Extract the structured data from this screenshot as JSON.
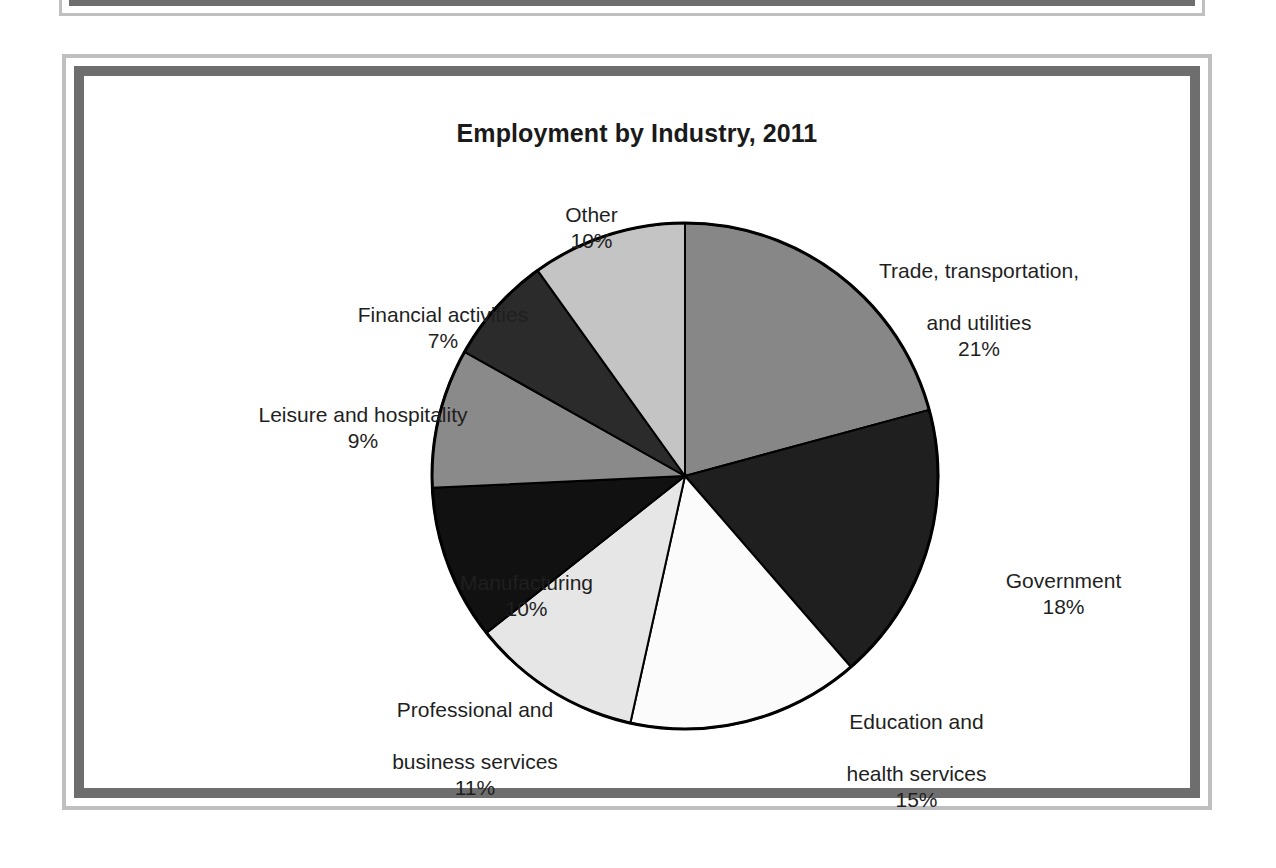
{
  "figure": {
    "title": "Employment by Industry, 2011"
  },
  "chart_data": {
    "type": "pie",
    "title": "Employment by Industry, 2011",
    "xlabel": "",
    "ylabel": "",
    "units": "percent",
    "legend_position": "none",
    "grid": false,
    "start_angle_deg": 0,
    "direction": "clockwise",
    "categories": [
      "Trade, transportation, and utilities",
      "Government",
      "Education and health services",
      "Professional and business services",
      "Manufacturing",
      "Leisure and hospitality",
      "Financial activities",
      "Other"
    ],
    "values": [
      21,
      18,
      15,
      11,
      10,
      9,
      7,
      10
    ],
    "slice_colors": [
      "#878787",
      "#1f1f1f",
      "#fbfbfb",
      "#e6e6e6",
      "#111111",
      "#8a8a8a",
      "#2b2b2b",
      "#c4c4c4"
    ],
    "slice_border_color": "#000000",
    "slices": [
      {
        "label": "Trade, transportation, and utilities",
        "value": 21,
        "display": "21%",
        "color": "#878787"
      },
      {
        "label": "Government",
        "value": 18,
        "display": "18%",
        "color": "#1f1f1f"
      },
      {
        "label": "Education and health services",
        "value": 15,
        "display": "15%",
        "color": "#fbfbfb"
      },
      {
        "label": "Professional and business services",
        "value": 11,
        "display": "11%",
        "color": "#e6e6e6"
      },
      {
        "label": "Manufacturing",
        "value": 10,
        "display": "10%",
        "color": "#111111"
      },
      {
        "label": "Leisure and hospitality",
        "value": 9,
        "display": "9%",
        "color": "#8a8a8a"
      },
      {
        "label": "Financial activities",
        "value": 7,
        "display": "7%",
        "color": "#2b2b2b"
      },
      {
        "label": "Other",
        "value": 10,
        "display": "10%",
        "color": "#c4c4c4"
      }
    ]
  },
  "labels": {
    "trade": {
      "line1": "Trade, transportation,",
      "line2": "and utilities",
      "pct": "21%"
    },
    "government": {
      "line1": "Government",
      "line2": "",
      "pct": "18%"
    },
    "education": {
      "line1": "Education and",
      "line2": "health services",
      "pct": "15%"
    },
    "professional": {
      "line1": "Professional and",
      "line2": "business services",
      "pct": "11%"
    },
    "manufacturing": {
      "line1": "Manufacturing",
      "line2": "",
      "pct": "10%"
    },
    "leisure": {
      "line1": "Leisure and hospitality",
      "line2": "",
      "pct": "9%"
    },
    "financial": {
      "line1": "Financial activities",
      "line2": "",
      "pct": "7%"
    },
    "other": {
      "line1": "Other",
      "line2": "",
      "pct": "10%"
    }
  },
  "style": {
    "frame_outer_color": "#bfbfbf",
    "frame_inner_color": "#6e6e6e",
    "page_background": "#ffffff",
    "text_color": "#1f1f1f"
  }
}
